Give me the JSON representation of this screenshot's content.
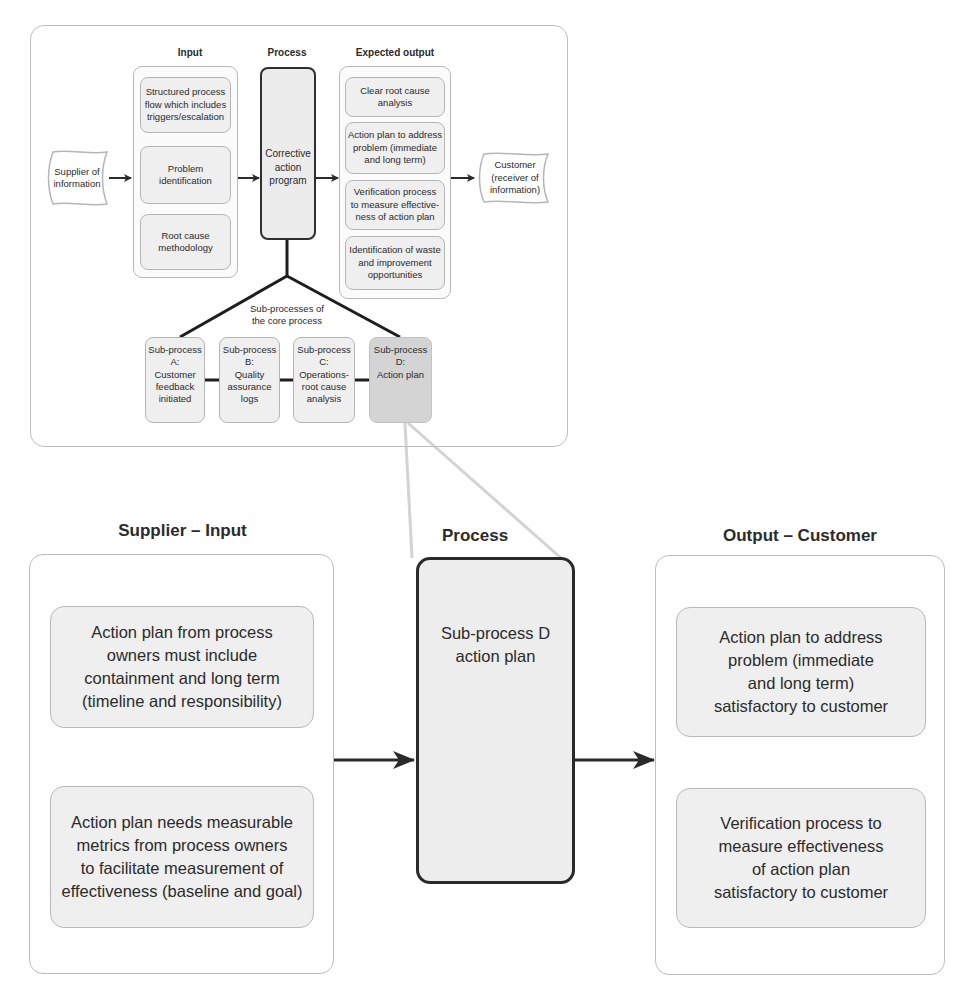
{
  "overview": {
    "headers": {
      "input": "Input",
      "process": "Process",
      "expected_output": "Expected output"
    },
    "supplier_flag": "Supplier of\ninformation",
    "customer_flag": "Customer\n(receiver of\ninformation)",
    "inputs": [
      "Structured process\nflow which includes\ntriggers/escalation",
      "Problem\nidentification",
      "Root cause\nmethodology"
    ],
    "core_process": "Corrective\naction\nprogram",
    "outputs": [
      "Clear root cause\nanalysis",
      "Action plan to address\nproblem (immediate\nand long term)",
      "Verification process\nto measure effective-\nness of action plan",
      "Identification of waste\nand improvement\nopportunities"
    ],
    "subprocess_caption": "Sub-processes of\nthe core process",
    "subprocesses": [
      {
        "label": "Sub-process\nA:\nCustomer\nfeedback\ninitiated",
        "highlighted": false
      },
      {
        "label": "Sub-process\nB:\nQuality\nassurance\nlogs",
        "highlighted": false
      },
      {
        "label": "Sub-process\nC:\nOperations-\nroot cause\nanalysis",
        "highlighted": false
      },
      {
        "label": "Sub-process\nD:\nAction plan",
        "highlighted": true
      }
    ]
  },
  "detail": {
    "supplier_input": {
      "title": "Supplier – Input",
      "items": [
        "Action plan from process\nowners must include\ncontainment and long term\n(timeline and responsibility)",
        "Action plan needs measurable\nmetrics from process owners\nto facilitate measurement of\neffectiveness (baseline and goal)"
      ]
    },
    "process": {
      "title": "Process",
      "box": "Sub-process D\naction plan"
    },
    "output_customer": {
      "title": "Output – Customer",
      "items": [
        "Action plan to address\nproblem (immediate\nand long term)\nsatisfactory to customer",
        "Verification process to\nmeasure effectiveness\nof action plan\nsatisfactory to customer"
      ]
    }
  },
  "colors": {
    "border_dark": "#2e2e2e",
    "border_light": "#b8b8b8",
    "fill_light": "#efefef",
    "fill_highlight": "#d4d4d4",
    "zoom_connector": "#d0d0d0"
  }
}
